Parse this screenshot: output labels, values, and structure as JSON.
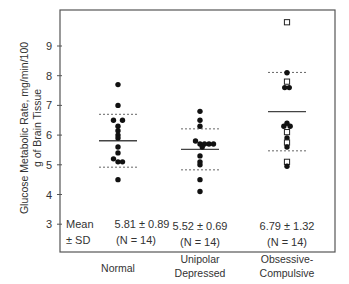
{
  "chart_data": {
    "type": "scatter",
    "title": "",
    "ylabel_lines": [
      "Glucose Metabolic Rate, mg/min/100",
      "g of Brain Tissue"
    ],
    "xlabel": "",
    "ylim": [
      2.2,
      10.3
    ],
    "yticks": [
      3,
      4,
      5,
      6,
      7,
      8,
      9
    ],
    "grid": false,
    "categories": [
      {
        "label_lines": [
          "Normal"
        ]
      },
      {
        "label_lines": [
          "Unipolar",
          "Depressed"
        ]
      },
      {
        "label_lines": [
          "Obsessive-",
          "Compulsive"
        ]
      }
    ],
    "series": [
      {
        "name": "Normal",
        "mean": 5.81,
        "sd": 0.89,
        "n": 14,
        "points": [
          {
            "y": 7.7,
            "dx": 0,
            "open": false
          },
          {
            "y": 7.0,
            "dx": 0,
            "open": false
          },
          {
            "y": 6.5,
            "dx": -1,
            "open": false
          },
          {
            "y": 6.5,
            "dx": 1,
            "open": false
          },
          {
            "y": 6.3,
            "dx": 0,
            "open": false
          },
          {
            "y": 6.15,
            "dx": 0,
            "open": false
          },
          {
            "y": 6.0,
            "dx": 0,
            "open": false
          },
          {
            "y": 5.9,
            "dx": 0,
            "open": false
          },
          {
            "y": 5.6,
            "dx": 0,
            "open": false
          },
          {
            "y": 5.4,
            "dx": 0,
            "open": false
          },
          {
            "y": 5.2,
            "dx": -1,
            "open": false
          },
          {
            "y": 5.1,
            "dx": 1,
            "open": false
          },
          {
            "y": 5.1,
            "dx": 0,
            "open": false
          },
          {
            "y": 4.5,
            "dx": 0,
            "open": false
          }
        ]
      },
      {
        "name": "Unipolar Depressed",
        "mean": 5.52,
        "sd": 0.69,
        "n": 14,
        "points": [
          {
            "y": 6.8,
            "dx": 0,
            "open": false
          },
          {
            "y": 6.5,
            "dx": 0,
            "open": false
          },
          {
            "y": 6.3,
            "dx": 0,
            "open": false
          },
          {
            "y": 5.8,
            "dx": -1,
            "open": false
          },
          {
            "y": 5.7,
            "dx": 0,
            "open": false
          },
          {
            "y": 5.7,
            "dx": 1,
            "open": false
          },
          {
            "y": 5.7,
            "dx": 2,
            "open": false
          },
          {
            "y": 5.7,
            "dx": 3,
            "open": false
          },
          {
            "y": 5.6,
            "dx": 0.5,
            "open": false
          },
          {
            "y": 5.3,
            "dx": 0,
            "open": false
          },
          {
            "y": 5.1,
            "dx": 0,
            "open": false
          },
          {
            "y": 5.0,
            "dx": 0,
            "open": false
          },
          {
            "y": 4.5,
            "dx": 0,
            "open": false
          },
          {
            "y": 4.1,
            "dx": 0,
            "open": false
          }
        ]
      },
      {
        "name": "Obsessive-Compulsive",
        "mean": 6.79,
        "sd": 1.32,
        "n": 14,
        "points": [
          {
            "y": 9.8,
            "dx": 0,
            "open": true
          },
          {
            "y": 8.1,
            "dx": 0,
            "open": false
          },
          {
            "y": 7.8,
            "dx": 0,
            "open": true
          },
          {
            "y": 7.6,
            "dx": -0.5,
            "open": false
          },
          {
            "y": 7.6,
            "dx": 0.5,
            "open": false
          },
          {
            "y": 6.4,
            "dx": 0,
            "open": false
          },
          {
            "y": 6.3,
            "dx": -0.7,
            "open": false
          },
          {
            "y": 6.3,
            "dx": 0.7,
            "open": false
          },
          {
            "y": 6.1,
            "dx": 0,
            "open": true
          },
          {
            "y": 5.9,
            "dx": 0,
            "open": false
          },
          {
            "y": 5.75,
            "dx": 0,
            "open": true
          },
          {
            "y": 5.6,
            "dx": 0,
            "open": false
          },
          {
            "y": 5.1,
            "dx": 0,
            "open": true
          },
          {
            "y": 4.95,
            "dx": 0,
            "open": false
          }
        ]
      }
    ],
    "stats_row_label": [
      "Mean",
      "± SD"
    ],
    "stats": [
      {
        "line1": "5.81 ± 0.89",
        "line2": "(N = 14)"
      },
      {
        "line1": "5.52 ± 0.69",
        "line2": "(N = 14)"
      },
      {
        "line1": "6.79 ± 1.32",
        "line2": "(N = 14)"
      }
    ],
    "legend": "none"
  }
}
